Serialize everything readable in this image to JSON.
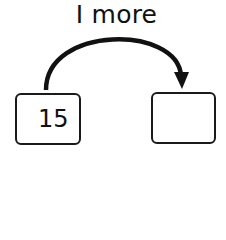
{
  "diagram": {
    "label": "I more",
    "start_box": {
      "value": "15"
    },
    "end_box": {
      "value": ""
    },
    "arrow": {
      "direction": "left-to-right",
      "shape": "arc"
    }
  },
  "colors": {
    "stroke": "#1a1a1a",
    "background": "#ffffff"
  }
}
